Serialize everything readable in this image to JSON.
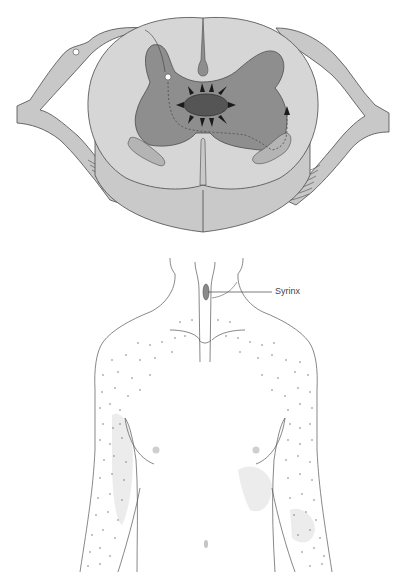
{
  "figure": {
    "top_panel": {
      "subject": "Spinal cord cross-section with central syrinx",
      "structures": [
        "dorsal-root",
        "ventral-root",
        "gray-matter",
        "white-matter",
        "central-canal-syrinx",
        "dorsal-median-septum",
        "ventral-median-fissure",
        "lateral-spinothalamic-tract",
        "crossing-pain-fiber"
      ]
    },
    "bottom_panel": {
      "subject": "Upper torso showing cape-like sensory loss distribution",
      "labels": {
        "syrinx": "Syrinx"
      }
    },
    "colors": {
      "white_matter": "#d6d6d6",
      "white_matter_lower": "#c9c9c9",
      "gray_matter": "#8e8e8e",
      "syrinx": "#555555",
      "arrows": "#1a1a1a",
      "nerve_roots": "#c8c8c8",
      "outline": "#4a4a4a",
      "sensory_dots": "#7a7a7a",
      "shading": "#ececec"
    }
  }
}
